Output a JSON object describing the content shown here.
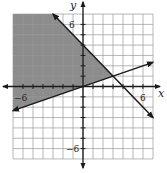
{
  "chart_data": {
    "type": "line",
    "title": "",
    "xlabel": "x",
    "ylabel": "y",
    "xlim": [
      -7,
      7
    ],
    "ylim": [
      -7,
      7
    ],
    "grid": true,
    "grid_step": 1,
    "tick_labels": {
      "x": [
        {
          "value": -6,
          "label": "−6"
        },
        {
          "value": 6,
          "label": "6"
        }
      ],
      "y": [
        {
          "value": 6,
          "label": "6"
        },
        {
          "value": -6,
          "label": "−6"
        }
      ]
    },
    "series": [
      {
        "name": "boundary-line-1",
        "equation": "y = -x + 4",
        "points": [
          [
            -3,
            7
          ],
          [
            7,
            -3
          ]
        ],
        "style": "solid",
        "arrows": "both"
      },
      {
        "name": "boundary-line-2",
        "equation": "y = x/3",
        "points": [
          [
            -7,
            -2.333
          ],
          [
            7,
            2.333
          ]
        ],
        "style": "solid",
        "arrows": "both"
      }
    ],
    "intersection": [
      3,
      1
    ],
    "shaded_region": {
      "description": "y >= x/3 and y <= -x + 4",
      "polygon": [
        [
          -7,
          7
        ],
        [
          -3,
          7
        ],
        [
          3,
          1
        ],
        [
          -7,
          -2.333
        ]
      ],
      "color": "#8c8c8c"
    }
  },
  "labels": {
    "x_axis": "x",
    "y_axis": "y",
    "x_neg": "−6",
    "x_pos": "6",
    "y_pos": "6",
    "y_neg": "−6"
  },
  "colors": {
    "shade": "#8c8c8c",
    "grid": "#9a9a9a",
    "line": "#1a1a1a"
  }
}
